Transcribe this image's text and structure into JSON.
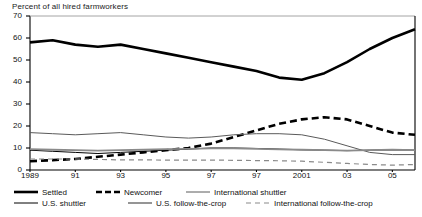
{
  "chart_data": {
    "type": "line",
    "title": "Percent of all hired farmworkers",
    "subtitle": "",
    "xlabel": "",
    "ylabel": "",
    "ylim": [
      0,
      70
    ],
    "xlim": [
      1989,
      2006
    ],
    "grid": false,
    "legend_position": "bottom",
    "ytick_labels": [
      "70",
      "60",
      "50",
      "40",
      "30",
      "20",
      "10",
      "0"
    ],
    "ytick_values": [
      70,
      60,
      50,
      40,
      30,
      20,
      10,
      0
    ],
    "xtick_labels": [
      "1989",
      "91",
      "93",
      "95",
      "97",
      "97",
      "2001",
      "03",
      "05"
    ],
    "xtick_values": [
      1989,
      1991,
      1993,
      1995,
      1997,
      1999,
      2001,
      2003,
      2005
    ],
    "x": [
      1989,
      1990,
      1991,
      1992,
      1993,
      1994,
      1995,
      1996,
      1997,
      1998,
      1999,
      2000,
      2001,
      2002,
      2003,
      2004,
      2005,
      2006
    ],
    "series": [
      {
        "name": "Settled",
        "style": "solid",
        "color": "#000000",
        "width": 2.6,
        "values": [
          58,
          59,
          57,
          56,
          57,
          55,
          53,
          51,
          49,
          47,
          45,
          42,
          41,
          44,
          49,
          55,
          60,
          64
        ]
      },
      {
        "name": "Newcomer",
        "style": "dashed",
        "color": "#000000",
        "width": 2.6,
        "values": [
          4,
          4.5,
          5,
          6,
          7,
          8,
          9,
          10,
          12,
          15,
          18,
          21,
          23,
          24,
          23,
          20,
          17,
          16
        ]
      },
      {
        "name": "International shuttler",
        "style": "solid",
        "color": "#5a5a5a",
        "width": 1.0,
        "values": [
          17,
          16.5,
          16,
          16.5,
          17,
          16,
          15,
          14.5,
          15,
          16,
          16.5,
          16.5,
          16,
          14,
          11,
          8,
          7,
          7
        ]
      },
      {
        "name": "U.S. shuttler",
        "style": "solid",
        "color": "#000000",
        "width": 1.0,
        "values": [
          9,
          8.5,
          8,
          7.5,
          8,
          8.5,
          9,
          9.5,
          10,
          10,
          9.8,
          9.5,
          9.2,
          9,
          8.8,
          9,
          9.2,
          9
        ]
      },
      {
        "name": "U.S. follow-the-crop",
        "style": "solid",
        "color": "#8a8a8a",
        "width": 1.8,
        "values": [
          9.5,
          9.2,
          9,
          8.8,
          9,
          9.2,
          9.5,
          9.6,
          9.8,
          9.8,
          9.6,
          9.4,
          9.2,
          9,
          8.8,
          9,
          9.2,
          9
        ]
      },
      {
        "name": "International follow-the-crop",
        "style": "dashed",
        "color": "#8a8a8a",
        "width": 1.2,
        "values": [
          5,
          5,
          5,
          4.8,
          4.6,
          4.6,
          4.5,
          4.5,
          4.5,
          4.4,
          4.3,
          4.2,
          4,
          3.5,
          3,
          2.5,
          2.2,
          2.5
        ]
      }
    ]
  },
  "legend": {
    "row1": [
      {
        "label": "Settled",
        "swatch": "solid-thick-black"
      },
      {
        "label": "Newcomer",
        "swatch": "dashed-thick-black"
      },
      {
        "label": "International shuttler",
        "swatch": "solid-thin-gray"
      }
    ],
    "row2": [
      {
        "label": "U.S. shuttler",
        "swatch": "solid-thin-black"
      },
      {
        "label": "U.S. follow-the-crop",
        "swatch": "solid-medium-gray"
      },
      {
        "label": "International follow-the-crop",
        "swatch": "dashed-thin-gray"
      }
    ]
  },
  "colors": {
    "axis": "#000000",
    "frame_top": "#9a9a9a",
    "text": "#111111"
  }
}
